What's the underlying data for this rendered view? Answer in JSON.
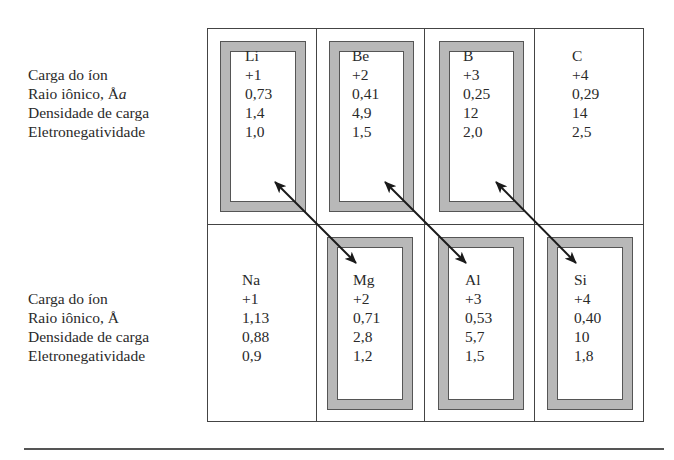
{
  "row_labels": {
    "top": [
      "Carga do íon",
      "Raio iônico, Å",
      "Densidade de carga",
      "Eletronegatividade"
    ],
    "top_radius_suffix": "a",
    "bottom": [
      "Carga do íon",
      "Raio iônico, Å",
      "Densidade de carga",
      "Eletronegatividade"
    ]
  },
  "elements": {
    "top": [
      {
        "symbol": "Li",
        "charge": "+1",
        "ionic_radius": "0,73",
        "charge_density": "1,4",
        "electronegativity": "1,0",
        "framed": true
      },
      {
        "symbol": "Be",
        "charge": "+2",
        "ionic_radius": "0,41",
        "charge_density": "4,9",
        "electronegativity": "1,5",
        "framed": true
      },
      {
        "symbol": "B",
        "charge": "+3",
        "ionic_radius": "0,25",
        "charge_density": "12",
        "electronegativity": "2,0",
        "framed": true
      },
      {
        "symbol": "C",
        "charge": "+4",
        "ionic_radius": "0,29",
        "charge_density": "14",
        "electronegativity": "2,5",
        "framed": false
      }
    ],
    "bottom": [
      {
        "symbol": "Na",
        "charge": "+1",
        "ionic_radius": "1,13",
        "charge_density": "0,88",
        "electronegativity": "0,9",
        "framed": false
      },
      {
        "symbol": "Mg",
        "charge": "+2",
        "ionic_radius": "0,71",
        "charge_density": "2,8",
        "electronegativity": "1,2",
        "framed": true
      },
      {
        "symbol": "Al",
        "charge": "+3",
        "ionic_radius": "0,53",
        "charge_density": "5,7",
        "electronegativity": "1,5",
        "framed": true
      },
      {
        "symbol": "Si",
        "charge": "+4",
        "ionic_radius": "0,40",
        "charge_density": "10",
        "electronegativity": "1,8",
        "framed": true
      }
    ]
  },
  "diagonal_relationships": [
    {
      "from": "Li",
      "to": "Mg"
    },
    {
      "from": "Be",
      "to": "Al"
    },
    {
      "from": "B",
      "to": "Si"
    }
  ],
  "colors": {
    "frame_fill": "#b8b8b8",
    "line": "#444444",
    "arrow": "#1a1a1a"
  }
}
